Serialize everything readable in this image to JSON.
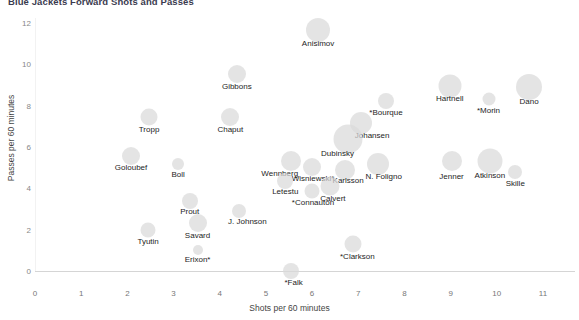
{
  "chart_data": {
    "type": "scatter",
    "title": "Blue Jackets Forward Shots and Passes",
    "xlabel": "Shots per 60 minutes",
    "ylabel": "Passes per 60 minutes",
    "xlim": [
      0,
      11
    ],
    "ylim": [
      0,
      12
    ],
    "xticks": [
      "0",
      "1",
      "2",
      "3",
      "4",
      "5",
      "6",
      "7",
      "8",
      "9",
      "10",
      "11"
    ],
    "yticks": [
      "0",
      "2",
      "4",
      "6",
      "8",
      "10",
      "12"
    ],
    "grid": false,
    "legend": "none",
    "bubble_color": "#d9d9d9",
    "points": [
      {
        "label": "Anisimov",
        "x": 6.13,
        "y": 11.65,
        "size": 24,
        "lx": 6.13,
        "ly": 11.05
      },
      {
        "label": "Gibbons",
        "x": 4.37,
        "y": 9.55,
        "size": 18,
        "lx": 4.37,
        "ly": 8.95
      },
      {
        "label": "Hartnell",
        "x": 8.98,
        "y": 8.95,
        "size": 23,
        "lx": 8.98,
        "ly": 8.35
      },
      {
        "label": "Dano",
        "x": 10.7,
        "y": 8.9,
        "size": 26,
        "lx": 10.7,
        "ly": 8.25
      },
      {
        "label": "*Morin",
        "x": 9.82,
        "y": 8.3,
        "size": 13,
        "lx": 9.82,
        "ly": 7.8
      },
      {
        "label": "*Bourque",
        "x": 7.6,
        "y": 8.25,
        "size": 16,
        "lx": 7.6,
        "ly": 7.7
      },
      {
        "label": "Tropp",
        "x": 2.47,
        "y": 7.45,
        "size": 17,
        "lx": 2.47,
        "ly": 6.85
      },
      {
        "label": "Chaput",
        "x": 4.23,
        "y": 7.45,
        "size": 18,
        "lx": 4.23,
        "ly": 6.85
      },
      {
        "label": "Johansen",
        "x": 7.06,
        "y": 7.15,
        "size": 22,
        "lx": 7.3,
        "ly": 6.6
      },
      {
        "label": "Dubinsky",
        "x": 6.77,
        "y": 6.4,
        "size": 29,
        "lx": 6.55,
        "ly": 5.7
      },
      {
        "label": "Goloubef",
        "x": 2.08,
        "y": 5.55,
        "size": 18,
        "lx": 2.08,
        "ly": 5.05
      },
      {
        "label": "Boll",
        "x": 3.1,
        "y": 5.2,
        "size": 12,
        "lx": 3.1,
        "ly": 4.7
      },
      {
        "label": "Wennberg",
        "x": 5.55,
        "y": 5.3,
        "size": 20,
        "lx": 5.3,
        "ly": 4.75
      },
      {
        "label": "Jenner",
        "x": 9.02,
        "y": 5.3,
        "size": 20,
        "lx": 9.02,
        "ly": 4.6
      },
      {
        "label": "Atkinson",
        "x": 9.85,
        "y": 5.3,
        "size": 25,
        "lx": 9.85,
        "ly": 4.65
      },
      {
        "label": "N. Foligno",
        "x": 7.42,
        "y": 5.2,
        "size": 22,
        "lx": 7.55,
        "ly": 4.62
      },
      {
        "label": "Karlsson",
        "x": 6.72,
        "y": 4.88,
        "size": 20,
        "lx": 6.78,
        "ly": 4.4
      },
      {
        "label": "Wisniewski*",
        "x": 6.0,
        "y": 5.05,
        "size": 18,
        "lx": 6.02,
        "ly": 4.5
      },
      {
        "label": "Skille",
        "x": 10.4,
        "y": 4.8,
        "size": 14,
        "lx": 10.4,
        "ly": 4.25
      },
      {
        "label": "Letestu",
        "x": 5.42,
        "y": 4.35,
        "size": 16,
        "lx": 5.42,
        "ly": 3.85
      },
      {
        "label": "Calvert",
        "x": 6.38,
        "y": 4.12,
        "size": 19,
        "lx": 6.45,
        "ly": 3.55
      },
      {
        "label": "*Connauton",
        "x": 6.0,
        "y": 3.88,
        "size": 15,
        "lx": 6.02,
        "ly": 3.35
      },
      {
        "label": "Prout",
        "x": 3.35,
        "y": 3.4,
        "size": 16,
        "lx": 3.35,
        "ly": 2.88
      },
      {
        "label": "J. Johnson",
        "x": 4.42,
        "y": 2.92,
        "size": 14,
        "lx": 4.6,
        "ly": 2.4
      },
      {
        "label": "Savard",
        "x": 3.52,
        "y": 2.3,
        "size": 18,
        "lx": 3.52,
        "ly": 1.75
      },
      {
        "label": "Tyutin",
        "x": 2.45,
        "y": 2.0,
        "size": 15,
        "lx": 2.45,
        "ly": 1.47
      },
      {
        "label": "*Clarkson",
        "x": 6.88,
        "y": 1.3,
        "size": 17,
        "lx": 6.98,
        "ly": 0.72
      },
      {
        "label": "Erixon*",
        "x": 3.52,
        "y": 1.0,
        "size": 10,
        "lx": 3.52,
        "ly": 0.58
      },
      {
        "label": "*Falk",
        "x": 5.55,
        "y": 0.02,
        "size": 16,
        "lx": 5.6,
        "ly": -0.55
      }
    ]
  }
}
